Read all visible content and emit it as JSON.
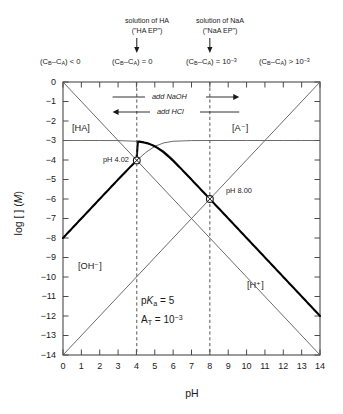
{
  "chart_data": {
    "type": "line",
    "title": "",
    "xlabel": "pH",
    "ylabel": "log [ ] (M)",
    "xlim": [
      0,
      14
    ],
    "ylim": [
      -14,
      0
    ],
    "grid": false,
    "legend_position": "inline-labels",
    "parameters": {
      "pKa": 5,
      "AT": "10⁻³",
      "pKa_text": "p",
      "pKa_italic": "K",
      "pKa_sub": "a",
      "pKa_value": "= 5",
      "AT_text": "A",
      "AT_sub": "T",
      "AT_value": "= 10",
      "AT_exp": "−3"
    },
    "series": [
      {
        "name": "[H+]",
        "label": "[H⁺]",
        "style": "thin",
        "x": [
          0,
          14
        ],
        "y": [
          0,
          -14
        ]
      },
      {
        "name": "[OH-]",
        "label": "[OH⁻]",
        "style": "thin",
        "x": [
          0,
          14
        ],
        "y": [
          -14,
          0
        ]
      },
      {
        "name": "[HA]",
        "label": "[HA]",
        "style": "thin-curve",
        "x": [
          0,
          1,
          2,
          3,
          4,
          4.5,
          5,
          5.5,
          6,
          7,
          8,
          9,
          10,
          11,
          12,
          13,
          14
        ],
        "y": [
          -3.0,
          -3.0,
          -3.0,
          -3.004,
          -3.04,
          -3.12,
          -3.3,
          -3.54,
          -3.96,
          -5.0,
          -6.0,
          -7.0,
          -8.0,
          -9.0,
          -10.0,
          -11.0,
          -12.0
        ]
      },
      {
        "name": "[A-]",
        "label": "[A⁻]",
        "style": "thin-curve",
        "x": [
          0,
          1,
          2,
          3,
          4,
          4.5,
          5,
          5.5,
          6,
          7,
          8,
          9,
          10,
          11,
          12,
          13,
          14
        ],
        "y": [
          -8.0,
          -7.0,
          -6.0,
          -5.0,
          -4.04,
          -3.62,
          -3.3,
          -3.12,
          -3.04,
          -3.004,
          -3.0,
          -3.0,
          -3.0,
          -3.0,
          -3.0,
          -3.0,
          -3.0
        ]
      },
      {
        "name": "proton-condition-bold",
        "label": "",
        "style": "bold",
        "x": [
          0,
          1,
          2,
          3,
          4,
          4.02,
          5,
          6,
          7,
          8,
          8.0,
          9,
          10,
          11,
          12,
          13,
          14
        ],
        "y": [
          -8.0,
          -7.0,
          -6.0,
          -5.0,
          -4.04,
          -4.02,
          -3.3,
          -3.04,
          -3.3,
          -6.0,
          -6.0,
          -7.05,
          -8.02,
          -9.0,
          -10.0,
          -11.0,
          -12.0
        ]
      }
    ],
    "equivalence_points": [
      {
        "label": "pH 4.02",
        "ph": 4.02,
        "log": -4.02,
        "marker": "crossed-circle"
      },
      {
        "label": "pH 8.00",
        "ph": 8.0,
        "log": -6.0,
        "marker": "crossed-circle"
      }
    ],
    "vertical_markers": [
      {
        "ph": 4.02,
        "style": "dashed"
      },
      {
        "ph": 8.0,
        "style": "dashed"
      }
    ],
    "ytick_labels": [
      "0",
      "−1",
      "−2",
      "−3",
      "−4",
      "−5",
      "−6",
      "−7",
      "−8",
      "−9",
      "−10",
      "−11",
      "−12",
      "−13",
      "−14"
    ],
    "xtick_labels": [
      "0",
      "1",
      "2",
      "3",
      "4",
      "5",
      "6",
      "7",
      "8",
      "9",
      "10",
      "11",
      "12",
      "13",
      "14"
    ]
  },
  "top_annotations": [
    {
      "line1": "solution of HA",
      "line2": "(\"HA EP\")",
      "ph": 4.02
    },
    {
      "line1": "solution of NaA",
      "line2": "(\"NaA EP\")",
      "ph": 8.0
    }
  ],
  "conditions": [
    {
      "open": "(C",
      "sub1": "B",
      "dash": "–C",
      "sub2": "A",
      "close": ")",
      "rel": " < 0",
      "exp": ""
    },
    {
      "open": "(C",
      "sub1": "B",
      "dash": "–C",
      "sub2": "A",
      "close": ")",
      "rel": " = 0",
      "exp": ""
    },
    {
      "open": "(C",
      "sub1": "B",
      "dash": "–C",
      "sub2": "A",
      "close": ")",
      "rel": " = 10",
      "exp": "−3"
    },
    {
      "open": "(C",
      "sub1": "B",
      "dash": "–C",
      "sub2": "A",
      "close": ")",
      "rel": " > 10",
      "exp": "−3"
    }
  ],
  "titration_arrows": [
    {
      "label": "add NaOH",
      "direction": "right"
    },
    {
      "label": "add HCl",
      "direction": "left"
    }
  ],
  "species_labels": {
    "ha": "[HA]",
    "a_minus": "[A⁻]",
    "oh_minus": "[OH⁻]",
    "h_plus": "[H⁺]"
  },
  "axis": {
    "x_title": "pH",
    "y_title_pre": "log [ ] (",
    "y_title_italic": "M",
    "y_title_post": ")"
  },
  "colors": {
    "ink": "#1a1a1a",
    "thin_line": "#5a5a5a",
    "bold_line": "#000000",
    "frame": "#4a4a4a",
    "dashed": "#555555",
    "background": "#ffffff"
  }
}
